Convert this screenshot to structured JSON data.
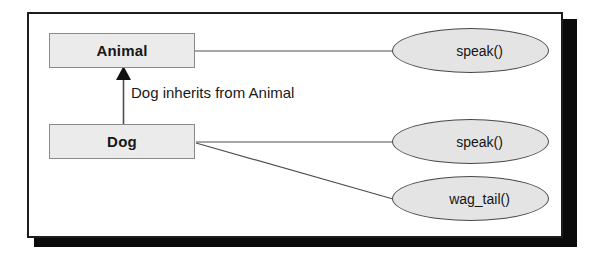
{
  "diagram": {
    "type": "uml-class-inheritance",
    "classes": [
      {
        "id": "animal",
        "name": "Animal"
      },
      {
        "id": "dog",
        "name": "Dog"
      }
    ],
    "methods": [
      {
        "id": "animal-speak",
        "owner": "Animal",
        "name": "speak()"
      },
      {
        "id": "dog-speak",
        "owner": "Dog",
        "name": "speak()"
      },
      {
        "id": "dog-wagtail",
        "owner": "Dog",
        "name": "wag_tail()"
      }
    ],
    "relationship": {
      "kind": "inheritance",
      "from": "Dog",
      "to": "Animal",
      "label": "Dog inherits from Animal"
    },
    "colors": {
      "class_box_fill": "#ebebeb",
      "class_box_border": "#8a8a8a",
      "ellipse_fill": "#e4e4e4",
      "ellipse_border": "#4a4a4a",
      "frame_border": "#1d1d1d",
      "frame_shadow": "#0b0b0b",
      "connector": "#4f4f4f",
      "text": "#171717",
      "background": "#ffffff"
    }
  }
}
